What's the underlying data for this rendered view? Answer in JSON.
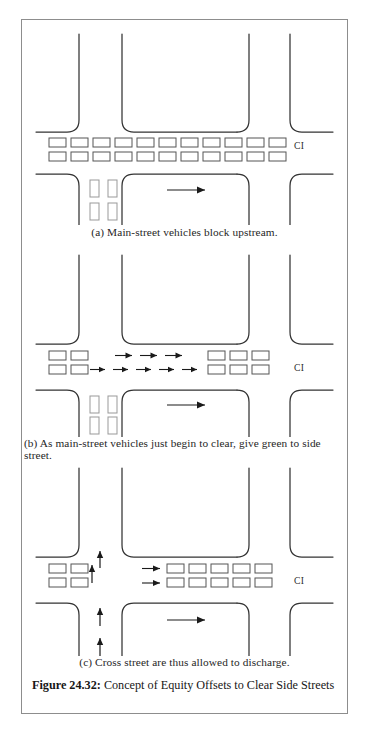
{
  "figure": {
    "number_label": "Figure 24.32:",
    "caption": "Concept of Equity Offsets to Clear Side Streets"
  },
  "panels": [
    {
      "id": "a",
      "caption": "(a) Main-street vehicles block upstream.",
      "ci_label": "CI",
      "queue_rows": [
        {
          "row": "upper",
          "main_street_vehicles": 11
        },
        {
          "row": "lower",
          "main_street_vehicles": 11
        }
      ],
      "main_street_arrows": 0,
      "downstream_vehicles_per_row": 0,
      "cross_street_vehicle_columns": 2,
      "cross_street_vehicles_per_column": 3,
      "cross_street_arrows": 0,
      "exit_arrow": "right"
    },
    {
      "id": "b",
      "caption": "(b) As main-street vehicles just begin to clear, give green to side street.",
      "ci_label": "CI",
      "queue_rows": [
        {
          "row": "upper",
          "upstream_vehicles": 2,
          "arrows": 3,
          "downstream_vehicles": 3
        },
        {
          "row": "lower",
          "upstream_vehicles": 2,
          "arrows": 5,
          "downstream_vehicles": 3
        }
      ],
      "cross_street_vehicle_columns": 2,
      "cross_street_vehicles_per_column": 3,
      "cross_street_arrows": 0,
      "exit_arrow": "right"
    },
    {
      "id": "c",
      "caption": "(c) Cross street are thus allowed to discharge.",
      "ci_label": "CI",
      "queue_rows": [
        {
          "row": "upper",
          "upstream_vehicles": 2,
          "arrows": 1,
          "downstream_vehicles": 5
        },
        {
          "row": "lower",
          "upstream_vehicles": 2,
          "arrows": 1,
          "downstream_vehicles": 5
        }
      ],
      "cross_street_vehicle_columns": 0,
      "cross_street_vehicles_per_column": 0,
      "cross_street_arrows": 4,
      "exit_arrow": "right"
    }
  ],
  "colors": {
    "ink": "#1a1a1a",
    "road_line": "#333333",
    "vehicle_outline": "#555555",
    "frame": "#8d8d8d",
    "background": "#ffffff"
  },
  "geometry": {
    "vehicle_horizontal": {
      "width": 17,
      "height": 9
    },
    "vehicle_vertical": {
      "width": 9,
      "height": 17
    },
    "corner_radius": 12
  }
}
